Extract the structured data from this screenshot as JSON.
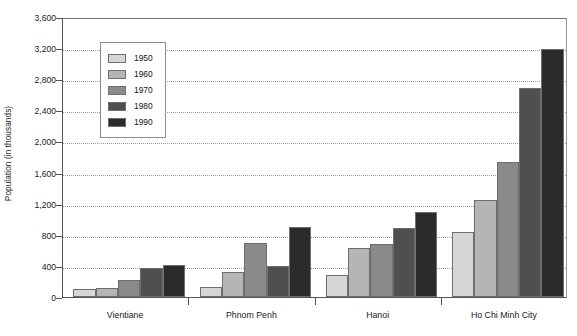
{
  "chart_data": {
    "type": "bar",
    "title": "",
    "subtitle": "",
    "xlabel": "",
    "ylabel": "Population (in thousands)",
    "categories": [
      "Vientiane",
      "Phnom Penh",
      "Hanoi",
      "Ho Chi Minh City"
    ],
    "series": [
      {
        "name": "1950",
        "color": "#d6d6d6",
        "values": [
          100,
          135,
          280,
          840
        ]
      },
      {
        "name": "1960",
        "color": "#b5b5b5",
        "values": [
          120,
          325,
          635,
          1250
        ]
      },
      {
        "name": "1970",
        "color": "#8a8a8a",
        "values": [
          215,
          690,
          685,
          1730
        ]
      },
      {
        "name": "1980",
        "color": "#4f4f4f",
        "values": [
          375,
          395,
          890,
          2690
        ]
      },
      {
        "name": "1990",
        "color": "#2b2b2b",
        "values": [
          410,
          895,
          1090,
          3195
        ]
      }
    ],
    "ylim": [
      0,
      3600
    ],
    "ytick_values": [
      0,
      400,
      800,
      1200,
      1600,
      2000,
      2400,
      2800,
      3200,
      3600
    ],
    "ytick_labels": [
      "0",
      "400",
      "800",
      "1,200",
      "1,600",
      "2,000",
      "2,400",
      "2,800",
      "3,200",
      "3,600"
    ],
    "grid": true,
    "grid_style": "dotted-horizontal",
    "legend_position": "upper-left-inside",
    "legend_entries": [
      "1950",
      "1960",
      "1970",
      "1980",
      "1990"
    ],
    "background_color": "#ffffff",
    "axis_color": "#555555"
  }
}
